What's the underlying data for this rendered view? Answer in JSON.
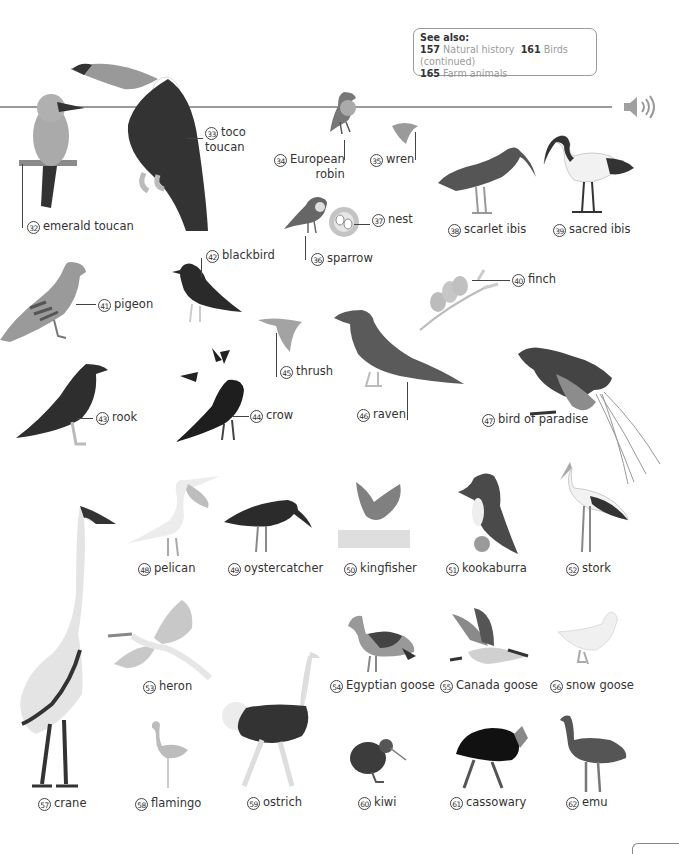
{
  "see_also": {
    "heading": "See also:",
    "refs": [
      {
        "page": "157",
        "title": "Natural history"
      },
      {
        "page": "161",
        "title": "Birds (continued)"
      },
      {
        "page": "165",
        "title": "Farm animals"
      }
    ]
  },
  "audio": {
    "icon": "speaker-icon"
  },
  "birds": [
    {
      "num": "32",
      "name": "emerald toucan"
    },
    {
      "num": "33",
      "name": "toco toucan",
      "line1": "toco",
      "line2": "toucan"
    },
    {
      "num": "34",
      "name": "European robin",
      "line1": "European",
      "line2": "robin"
    },
    {
      "num": "35",
      "name": "wren"
    },
    {
      "num": "36",
      "name": "sparrow"
    },
    {
      "num": "37",
      "name": "nest"
    },
    {
      "num": "38",
      "name": "scarlet ibis"
    },
    {
      "num": "39",
      "name": "sacred ibis"
    },
    {
      "num": "40",
      "name": "finch"
    },
    {
      "num": "41",
      "name": "pigeon"
    },
    {
      "num": "42",
      "name": "blackbird"
    },
    {
      "num": "43",
      "name": "rook"
    },
    {
      "num": "44",
      "name": "crow"
    },
    {
      "num": "45",
      "name": "thrush"
    },
    {
      "num": "46",
      "name": "raven"
    },
    {
      "num": "47",
      "name": "bird of paradise"
    },
    {
      "num": "48",
      "name": "pelican"
    },
    {
      "num": "49",
      "name": "oystercatcher"
    },
    {
      "num": "50",
      "name": "kingfisher"
    },
    {
      "num": "51",
      "name": "kookaburra"
    },
    {
      "num": "52",
      "name": "stork"
    },
    {
      "num": "53",
      "name": "heron"
    },
    {
      "num": "54",
      "name": "Egyptian goose"
    },
    {
      "num": "55",
      "name": "Canada goose"
    },
    {
      "num": "56",
      "name": "snow goose"
    },
    {
      "num": "57",
      "name": "crane"
    },
    {
      "num": "58",
      "name": "flamingo"
    },
    {
      "num": "59",
      "name": "ostrich"
    },
    {
      "num": "60",
      "name": "kiwi"
    },
    {
      "num": "61",
      "name": "cassowary"
    },
    {
      "num": "62",
      "name": "emu"
    }
  ]
}
